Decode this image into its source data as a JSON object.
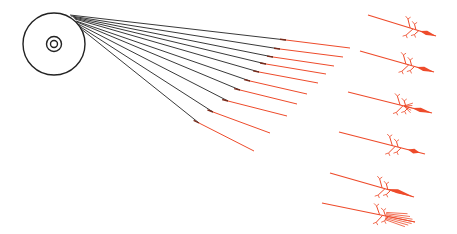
{
  "diagram": {
    "width": 457,
    "height": 234,
    "colors": {
      "ink": "#222222",
      "accent": "#ee4b2b",
      "background": "#ffffff"
    },
    "source_disc": {
      "cx": 54,
      "cy": 44,
      "r_outer": 31,
      "r_ring": 7.5,
      "r_hub": 3.5
    },
    "fan_rays": [
      {
        "x1": 70,
        "y1": 15,
        "xm": 286,
        "ym": 40,
        "x2": 350,
        "y2": 48
      },
      {
        "x1": 71,
        "y1": 16,
        "xm": 280,
        "ym": 49,
        "x2": 343,
        "y2": 57
      },
      {
        "x1": 73,
        "y1": 17,
        "xm": 273,
        "ym": 57,
        "x2": 334,
        "y2": 66
      },
      {
        "x1": 74,
        "y1": 18,
        "xm": 266,
        "ym": 64,
        "x2": 326,
        "y2": 74
      },
      {
        "x1": 75,
        "y1": 19,
        "xm": 259,
        "ym": 72,
        "x2": 318,
        "y2": 83
      },
      {
        "x1": 76,
        "y1": 21,
        "xm": 250,
        "ym": 81,
        "x2": 307,
        "y2": 94
      },
      {
        "x1": 77,
        "y1": 22,
        "xm": 240,
        "ym": 90,
        "x2": 297,
        "y2": 104
      },
      {
        "x1": 78,
        "y1": 24,
        "xm": 228,
        "ym": 101,
        "x2": 287,
        "y2": 116
      },
      {
        "x1": 79,
        "y1": 26,
        "xm": 213,
        "ym": 112,
        "x2": 270,
        "y2": 133
      },
      {
        "x1": 80,
        "y1": 28,
        "xm": 199,
        "ym": 123,
        "x2": 254,
        "y2": 151
      }
    ],
    "arrow_figures": [
      {
        "x1": 368,
        "y1": 15,
        "x2": 436,
        "y2": 36,
        "type": "fletched-dart"
      },
      {
        "x1": 360,
        "y1": 51,
        "x2": 434,
        "y2": 72,
        "type": "fletched-dart"
      },
      {
        "x1": 348,
        "y1": 92,
        "x2": 432,
        "y2": 113,
        "type": "fletched-spray"
      },
      {
        "x1": 339,
        "y1": 132,
        "x2": 425,
        "y2": 154,
        "type": "fletched-bead"
      },
      {
        "x1": 330,
        "y1": 173,
        "x2": 414,
        "y2": 197,
        "type": "fletched-blade"
      },
      {
        "x1": 322,
        "y1": 203,
        "x2": 415,
        "y2": 222,
        "type": "fletched-brush"
      }
    ]
  }
}
